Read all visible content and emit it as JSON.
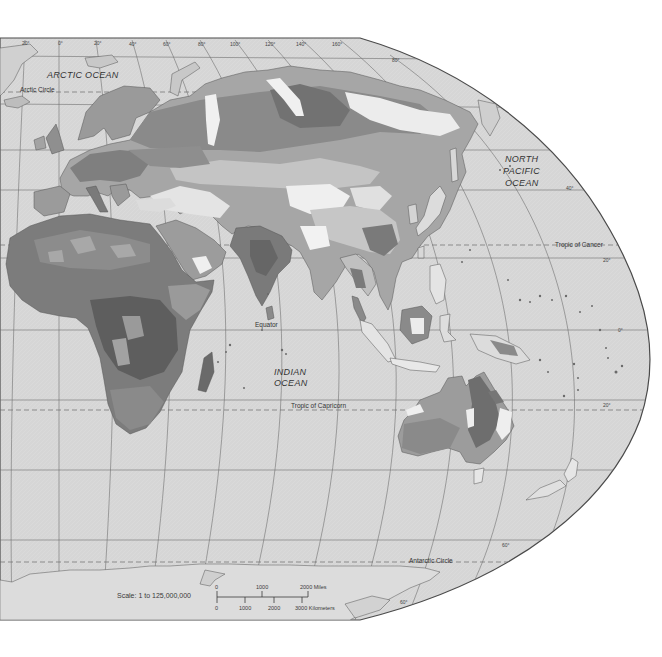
{
  "map": {
    "title": "Eastern Hemisphere physical/vegetation map (grayscale)",
    "colors": {
      "ocean": "#d9d9d9",
      "border": "#555555",
      "graticule": "#6e6e6e",
      "land_light": "#efefef",
      "land_mid_light": "#c8c8c8",
      "land_mid": "#a9a9a9",
      "land_mid_dark": "#8c8c8c",
      "land_dark": "#6f6f6f",
      "land_darkest": "#575757",
      "background": "#ffffff"
    },
    "ocean_labels": {
      "arctic": "ARCTIC  OCEAN",
      "pacific_line1": "NORTH",
      "pacific_line2": "PACIFIC",
      "pacific_line3": "OCEAN",
      "indian_line1": "INDIAN",
      "indian_line2": "OCEAN"
    },
    "line_labels": {
      "arctic_circle": "Arctic Circle",
      "tropic_cancer": "Tropic of Cancer",
      "equator": "Equator",
      "tropic_capricorn": "Tropic of Capricorn",
      "antarctic_circle": "Antarctic Circle"
    },
    "longitude_ticks": [
      "20°",
      "0°",
      "20°",
      "40°",
      "60°",
      "80°",
      "100°",
      "120°",
      "140°",
      "160°"
    ],
    "latitude_ticks": {
      "n80": "80°",
      "n40": "40°",
      "n20": "20°",
      "eq": "0°",
      "s20": "20°",
      "s60": "60°",
      "s60_bottom": "60°"
    },
    "scale": {
      "label": "Scale:  1 to 125,000,000",
      "miles_ticks": [
        "0",
        "1000",
        "2000 Miles"
      ],
      "km_ticks": [
        "0",
        "1000",
        "2000",
        "3000 Kilometers"
      ]
    }
  }
}
